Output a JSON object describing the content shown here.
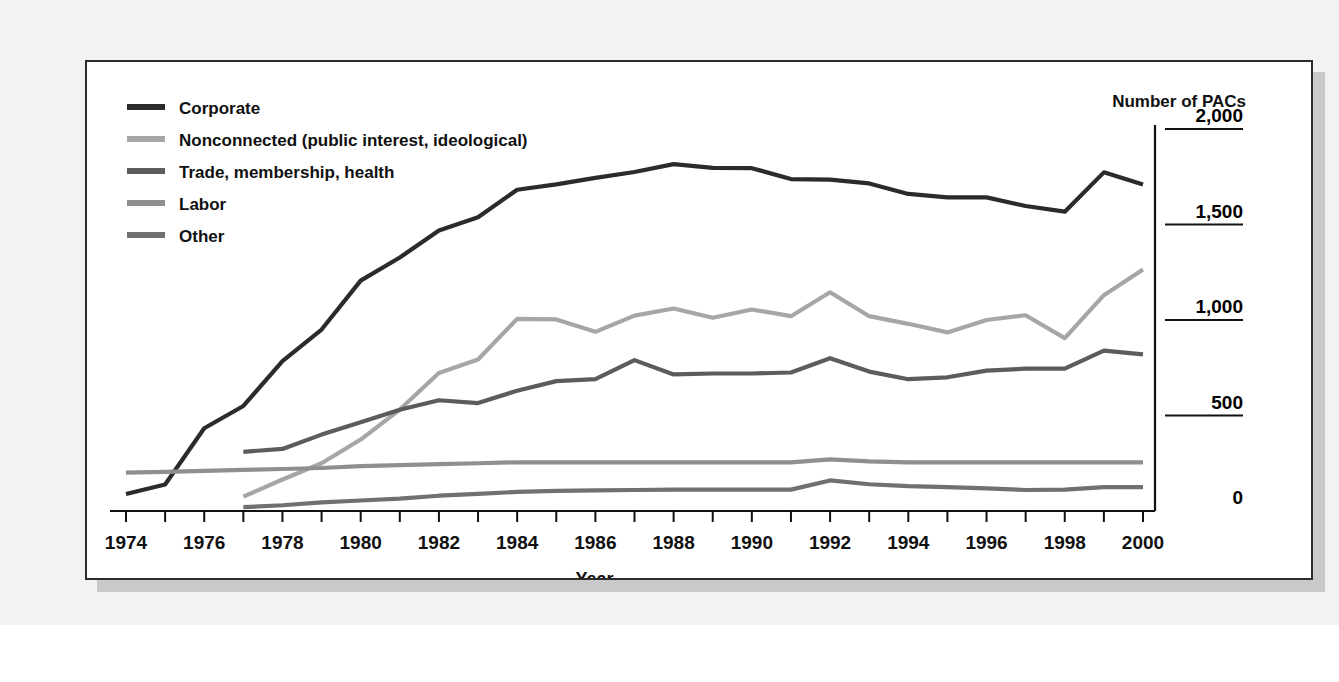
{
  "figure": {
    "y_axis_unit_label": "Number of PACs",
    "x_axis_label": "Year"
  },
  "legend": {
    "position": "top-left",
    "items": [
      {
        "label": "Corporate",
        "color": "#2b2b2b"
      },
      {
        "label": "Nonconnected (public interest, ideological)",
        "color": "#a6a6a6"
      },
      {
        "label": "Trade, membership, health",
        "color": "#5c5c5c"
      },
      {
        "label": "Labor",
        "color": "#8f8f8f"
      },
      {
        "label": "Other",
        "color": "#707070"
      }
    ]
  },
  "chart_data": {
    "type": "line",
    "title": "",
    "subtitle": "",
    "xlabel": "Year",
    "ylabel": "Number of PACs",
    "xlim": [
      1974,
      2000
    ],
    "ylim": [
      0,
      2000
    ],
    "yticks": [
      0,
      500,
      1000,
      1500,
      2000
    ],
    "ytick_labels": [
      "0",
      "500",
      "1,000",
      "1,500",
      "2,000"
    ],
    "xticks": [
      1974,
      1975,
      1976,
      1977,
      1978,
      1979,
      1980,
      1981,
      1982,
      1983,
      1984,
      1985,
      1986,
      1987,
      1988,
      1989,
      1990,
      1991,
      1992,
      1993,
      1994,
      1995,
      1996,
      1997,
      1998,
      1999,
      2000
    ],
    "xtick_labels_shown": [
      "1974",
      "1976",
      "1978",
      "1980",
      "1982",
      "1984",
      "1986",
      "1988",
      "1990",
      "1992",
      "1994",
      "1996",
      "1998",
      "2000"
    ],
    "grid": false,
    "y_axis_side": "right",
    "legend_position": "top-left",
    "series": [
      {
        "name": "Corporate",
        "color": "#2b2b2b",
        "x": [
          1974,
          1975,
          1976,
          1977,
          1978,
          1979,
          1980,
          1981,
          1982,
          1983,
          1984,
          1985,
          1986,
          1987,
          1988,
          1989,
          1990,
          1991,
          1992,
          1993,
          1994,
          1995,
          1996,
          1997,
          1998,
          1999,
          2000
        ],
        "values": [
          89,
          139,
          433,
          550,
          785,
          950,
          1206,
          1327,
          1469,
          1538,
          1682,
          1710,
          1744,
          1775,
          1816,
          1796,
          1795,
          1738,
          1735,
          1715,
          1660,
          1642,
          1642,
          1597,
          1567,
          1773,
          1710
        ]
      },
      {
        "name": "Nonconnected (public interest, ideological)",
        "color": "#a6a6a6",
        "x": [
          1977,
          1978,
          1979,
          1980,
          1981,
          1982,
          1983,
          1984,
          1985,
          1986,
          1987,
          1988,
          1989,
          1990,
          1991,
          1992,
          1993,
          1994,
          1995,
          1996,
          1997,
          1998,
          1999,
          2000
        ],
        "values": [
          75,
          165,
          250,
          374,
          531,
          723,
          793,
          1006,
          1003,
          938,
          1023,
          1060,
          1012,
          1055,
          1020,
          1145,
          1020,
          980,
          935,
          1000,
          1025,
          905,
          1130,
          1265
        ]
      },
      {
        "name": "Trade, membership, health",
        "color": "#5c5c5c",
        "x": [
          1977,
          1978,
          1979,
          1980,
          1981,
          1982,
          1983,
          1984,
          1985,
          1986,
          1987,
          1988,
          1989,
          1990,
          1991,
          1992,
          1993,
          1994,
          1995,
          1996,
          1997,
          1998,
          1999,
          2000
        ],
        "values": [
          310,
          325,
          400,
          465,
          530,
          580,
          565,
          630,
          680,
          690,
          790,
          715,
          720,
          720,
          725,
          800,
          730,
          690,
          700,
          735,
          745,
          745,
          840,
          820
        ]
      },
      {
        "name": "Labor",
        "color": "#8f8f8f",
        "x": [
          1974,
          1975,
          1976,
          1977,
          1978,
          1979,
          1980,
          1981,
          1982,
          1983,
          1984,
          1985,
          1986,
          1987,
          1988,
          1989,
          1990,
          1991,
          1992,
          1993,
          1994,
          1995,
          1996,
          1997,
          1998,
          1999,
          2000
        ],
        "values": [
          201,
          205,
          210,
          215,
          220,
          225,
          235,
          240,
          245,
          250,
          255,
          255,
          255,
          255,
          255,
          255,
          255,
          255,
          270,
          260,
          255,
          255,
          255,
          255,
          255,
          255,
          255
        ]
      },
      {
        "name": "Other",
        "color": "#707070",
        "x": [
          1977,
          1978,
          1979,
          1980,
          1981,
          1982,
          1983,
          1984,
          1985,
          1986,
          1987,
          1988,
          1989,
          1990,
          1991,
          1992,
          1993,
          1994,
          1995,
          1996,
          1997,
          1998,
          1999,
          2000
        ],
        "values": [
          20,
          30,
          45,
          55,
          65,
          80,
          90,
          100,
          105,
          108,
          110,
          112,
          112,
          112,
          112,
          160,
          140,
          130,
          125,
          118,
          110,
          112,
          125,
          125
        ]
      }
    ]
  }
}
